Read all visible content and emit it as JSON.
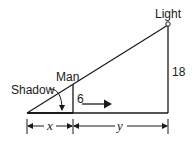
{
  "diagram": {
    "labels": {
      "light": "Light",
      "man": "Man",
      "shadow": "Shadow",
      "man_height": "6",
      "light_height": "18",
      "x_dim": "x",
      "y_dim": "y"
    },
    "colors": {
      "line": "#1a1a1a",
      "background": "#ffffff"
    }
  }
}
